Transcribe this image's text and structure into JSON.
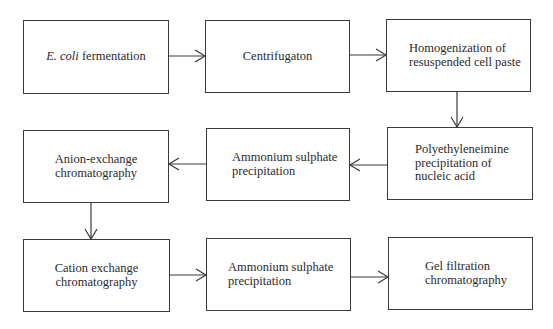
{
  "diagram": {
    "type": "flowchart",
    "steps": [
      {
        "id": "A",
        "italic_prefix": "E. coli",
        "label": " fermentation"
      },
      {
        "id": "B",
        "label": "Centrifugaton"
      },
      {
        "id": "C",
        "lines": [
          "Homogenization of",
          "resuspended cell paste"
        ]
      },
      {
        "id": "F",
        "lines": [
          "Polyethyleneimine",
          "precipitation of",
          "nucleic acid"
        ]
      },
      {
        "id": "E",
        "lines": [
          "Ammonium sulphate",
          "precipitation"
        ]
      },
      {
        "id": "D",
        "lines": [
          "Anion-exchange",
          "chromatography"
        ]
      },
      {
        "id": "G",
        "lines": [
          "Cation exchange",
          "chromatography"
        ]
      },
      {
        "id": "H",
        "lines": [
          "Ammonium sulphate",
          "precipitation"
        ]
      },
      {
        "id": "I",
        "lines": [
          "Gel filtration",
          "chromatography"
        ]
      }
    ],
    "edges": [
      [
        "A",
        "B"
      ],
      [
        "B",
        "C"
      ],
      [
        "C",
        "F"
      ],
      [
        "F",
        "E"
      ],
      [
        "E",
        "D"
      ],
      [
        "D",
        "G"
      ],
      [
        "G",
        "H"
      ],
      [
        "H",
        "I"
      ]
    ],
    "colors": {
      "line": "#3a3a3a",
      "text": "#2a2a2a",
      "background": "#ffffff"
    }
  }
}
